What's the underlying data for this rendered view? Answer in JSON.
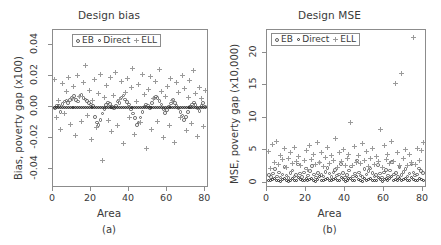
{
  "figure": {
    "panels": [
      {
        "tag": "(a)",
        "title": "Design bias",
        "xlabel": "Area",
        "ylabel": "Bias, poverty gap (x100)",
        "xticks": [
          "0",
          "20",
          "40",
          "60",
          "80"
        ],
        "yticks": [
          "-0.04",
          "-0.02",
          "0.00",
          "0.02",
          "0.04"
        ]
      },
      {
        "tag": "(b)",
        "title": "Design MSE",
        "xlabel": "Area",
        "ylabel": "MSE, poverty gap (x10,000)",
        "xticks": [
          "0",
          "20",
          "40",
          "60",
          "80"
        ],
        "yticks": [
          "0",
          "5",
          "10",
          "15",
          "20"
        ]
      }
    ],
    "legend": {
      "entries": [
        {
          "label": "EB",
          "marker": "open-circle-icon",
          "color": "#5c5c5c"
        },
        {
          "label": "Direct",
          "marker": "filled-circle-icon",
          "color": "#2a2a2a"
        },
        {
          "label": "ELL",
          "marker": "plus-icon",
          "color": "#9a9a9a"
        }
      ]
    }
  },
  "chart_data": [
    {
      "type": "scatter",
      "title": "Design bias",
      "xlabel": "Area",
      "ylabel": "Bias, poverty gap (x100)",
      "panel": "(a)",
      "xlim": [
        0,
        82
      ],
      "ylim": [
        -0.052,
        0.05
      ],
      "xticks": [
        0,
        20,
        40,
        60,
        80
      ],
      "yticks": [
        -0.04,
        -0.02,
        0.0,
        0.02,
        0.04
      ],
      "grid": false,
      "legend_position": "top-center-inside",
      "reference_line_y": 0,
      "x": [
        1,
        2,
        3,
        4,
        5,
        6,
        7,
        8,
        9,
        10,
        11,
        12,
        13,
        14,
        15,
        16,
        17,
        18,
        19,
        20,
        21,
        22,
        23,
        24,
        25,
        26,
        27,
        28,
        29,
        30,
        31,
        32,
        33,
        34,
        35,
        36,
        37,
        38,
        39,
        40,
        41,
        42,
        43,
        44,
        45,
        46,
        47,
        48,
        49,
        50,
        51,
        52,
        53,
        54,
        55,
        56,
        57,
        58,
        59,
        60,
        61,
        62,
        63,
        64,
        65,
        66,
        67,
        68,
        69,
        70,
        71,
        72,
        73,
        74,
        75,
        76,
        77,
        78,
        79,
        80
      ],
      "series": [
        {
          "name": "EB",
          "marker": "open-circle",
          "values": [
            -0.0005,
            0.0012,
            0.0008,
            -0.003,
            0.0021,
            0.0039,
            0.0045,
            0.0028,
            0.0049,
            0.0061,
            0.0073,
            0.0048,
            0.0039,
            0.007,
            0.0082,
            0.006,
            0.0052,
            0.0043,
            0.0028,
            0.0018,
            0.001,
            -0.006,
            -0.0098,
            -0.0115,
            -0.0082,
            -0.004,
            -0.001,
            0.0014,
            0.0032,
            0.0021,
            0.0004,
            -0.0008,
            0.001,
            0.0038,
            0.003,
            0.0063,
            0.0078,
            0.0052,
            0.0036,
            0.0018,
            -0.0012,
            -0.0038,
            -0.007,
            -0.0112,
            -0.0098,
            -0.0065,
            -0.003,
            0.0006,
            0.002,
            0.0012,
            -0.0004,
            0.003,
            0.0058,
            0.0072,
            0.0061,
            0.004,
            0.0018,
            -0.001,
            -0.0034,
            -0.0018,
            0.0006,
            0.0026,
            0.0048,
            0.003,
            0.0012,
            -0.0008,
            -0.0028,
            -0.0052,
            -0.008,
            -0.0062,
            -0.003,
            0.0002,
            0.0018,
            0.0032,
            0.0014,
            -0.0006,
            -0.0022,
            0.001,
            0.0028,
            0.0006
          ]
        },
        {
          "name": "Direct",
          "marker": "filled-circle",
          "values": [
            0.0,
            0.0001,
            -0.0001,
            0.0,
            0.0002,
            -0.0001,
            0.0,
            0.0001,
            -0.0002,
            0.0,
            0.0001,
            0.0,
            -0.0001,
            0.0002,
            0.0,
            0.0001,
            -0.0001,
            0.0,
            0.0001,
            -0.0002,
            0.0,
            0.0001,
            0.0,
            -0.0001,
            0.0002,
            0.0,
            -0.0001,
            0.0001,
            0.0,
            0.0002,
            -0.0001,
            0.0,
            0.0001,
            -0.0002,
            0.0,
            0.0001,
            0.0,
            -0.0001,
            0.0002,
            0.0,
            0.0001,
            -0.0001,
            0.0,
            0.0002,
            -0.0001,
            0.0,
            0.0001,
            0.0,
            -0.0002,
            0.0001,
            0.0,
            -0.0001,
            0.0002,
            0.0,
            0.0001,
            -0.0001,
            0.0,
            0.0002,
            0.0,
            -0.0001,
            0.0001,
            0.0,
            -0.0002,
            0.0001,
            0.0,
            0.0002,
            -0.0001,
            0.0,
            0.0001,
            -0.0001,
            0.0,
            0.0002,
            0.0,
            -0.0001,
            0.0001,
            0.0,
            -0.0002,
            0.0001,
            0.0,
            0.0001
          ]
        },
        {
          "name": "ELL",
          "marker": "plus",
          "values": [
            0.0182,
            -0.0068,
            0.0048,
            -0.014,
            0.0155,
            -0.0042,
            0.0104,
            0.0196,
            -0.0112,
            0.006,
            0.0138,
            -0.018,
            0.0205,
            0.0072,
            -0.0092,
            0.0158,
            0.0268,
            -0.0055,
            0.0112,
            -0.0205,
            0.0046,
            0.0178,
            -0.0128,
            0.0092,
            0.0215,
            -0.034,
            0.0064,
            0.0142,
            -0.0085,
            0.0196,
            -0.0158,
            0.0078,
            0.0225,
            -0.0118,
            0.0052,
            0.0168,
            -0.0235,
            0.0098,
            0.0188,
            -0.0062,
            0.0128,
            0.0252,
            -0.0175,
            0.004,
            0.0145,
            -0.0098,
            0.0212,
            0.0082,
            -0.0268,
            0.0118,
            0.0198,
            -0.0142,
            0.0058,
            0.0165,
            -0.0088,
            0.0248,
            0.0102,
            -0.0192,
            0.0072,
            0.0138,
            -0.0115,
            0.0185,
            0.0042,
            -0.0228,
            0.0158,
            0.0095,
            -0.0068,
            0.0205,
            0.0122,
            -0.0148,
            0.0065,
            0.0175,
            -0.0102,
            0.0238,
            0.0088,
            -0.0185,
            0.0132,
            0.0058,
            -0.0122,
            0.0108
          ]
        }
      ]
    },
    {
      "type": "scatter",
      "title": "Design MSE",
      "xlabel": "Area",
      "ylabel": "MSE, poverty gap (x10,000)",
      "panel": "(b)",
      "xlim": [
        0,
        82
      ],
      "ylim": [
        -0.8,
        23.5
      ],
      "xticks": [
        0,
        20,
        40,
        60,
        80
      ],
      "yticks": [
        0,
        5,
        10,
        15,
        20
      ],
      "grid": false,
      "legend_position": "top-left-inside",
      "x": [
        1,
        2,
        3,
        4,
        5,
        6,
        7,
        8,
        9,
        10,
        11,
        12,
        13,
        14,
        15,
        16,
        17,
        18,
        19,
        20,
        21,
        22,
        23,
        24,
        25,
        26,
        27,
        28,
        29,
        30,
        31,
        32,
        33,
        34,
        35,
        36,
        37,
        38,
        39,
        40,
        41,
        42,
        43,
        44,
        45,
        46,
        47,
        48,
        49,
        50,
        51,
        52,
        53,
        54,
        55,
        56,
        57,
        58,
        59,
        60,
        61,
        62,
        63,
        64,
        65,
        66,
        67,
        68,
        69,
        70,
        71,
        72,
        73,
        74,
        75,
        76,
        77,
        78,
        79,
        80
      ],
      "series": [
        {
          "name": "EB",
          "marker": "open-circle",
          "values": [
            1.2,
            0.9,
            1.4,
            2.1,
            1.0,
            1.6,
            0.8,
            1.3,
            2.4,
            1.1,
            0.7,
            1.5,
            1.9,
            1.0,
            1.2,
            2.8,
            1.4,
            0.9,
            1.6,
            2.2,
            1.1,
            1.8,
            2.6,
            1.3,
            0.8,
            1.5,
            3.1,
            1.2,
            1.0,
            1.7,
            2.3,
            1.4,
            0.9,
            1.6,
            2.0,
            1.1,
            1.3,
            2.9,
            1.5,
            0.8,
            1.2,
            1.9,
            2.5,
            1.0,
            1.4,
            3.4,
            1.6,
            1.1,
            0.9,
            2.1,
            1.3,
            1.8,
            2.2,
            1.5,
            1.0,
            1.2,
            2.7,
            1.4,
            0.8,
            1.6,
            2.0,
            1.1,
            1.9,
            3.2,
            1.3,
            1.5,
            0.9,
            2.4,
            1.2,
            1.7,
            2.1,
            1.0,
            1.4,
            2.8,
            1.6,
            1.1,
            1.3,
            2.2,
            1.8,
            1.5
          ]
        },
        {
          "name": "Direct",
          "marker": "filled-circle",
          "values": [
            0.4,
            0.3,
            0.5,
            0.6,
            0.3,
            0.4,
            0.2,
            0.5,
            0.7,
            0.3,
            0.2,
            0.4,
            0.6,
            0.3,
            0.4,
            0.8,
            0.5,
            0.3,
            0.4,
            0.6,
            0.3,
            0.5,
            0.7,
            0.4,
            0.2,
            0.5,
            0.9,
            0.4,
            0.3,
            0.5,
            0.6,
            0.4,
            0.3,
            0.5,
            0.6,
            0.3,
            0.4,
            0.8,
            0.5,
            0.2,
            0.4,
            0.6,
            0.7,
            0.3,
            0.4,
            1.0,
            0.5,
            0.3,
            0.2,
            0.6,
            0.4,
            0.5,
            0.6,
            0.4,
            0.3,
            0.4,
            0.8,
            0.5,
            0.2,
            0.5,
            0.6,
            0.3,
            0.6,
            0.9,
            0.4,
            0.5,
            0.3,
            0.7,
            0.4,
            0.5,
            0.6,
            0.3,
            0.4,
            0.8,
            0.5,
            0.3,
            0.4,
            0.6,
            0.5,
            0.4
          ]
        },
        {
          "name": "ELL",
          "marker": "plus",
          "values": [
            4.8,
            2.2,
            5.9,
            3.1,
            6.4,
            2.8,
            4.2,
            3.6,
            5.2,
            2.4,
            3.8,
            4.6,
            2.9,
            5.5,
            3.2,
            4.1,
            2.6,
            22.6,
            3.4,
            4.9,
            2.1,
            5.8,
            3.6,
            4.4,
            2.8,
            6.2,
            3.1,
            4.7,
            2.5,
            3.9,
            5.4,
            2.9,
            4.2,
            3.5,
            6.8,
            2.3,
            4.6,
            3.2,
            5.1,
            2.7,
            3.8,
            4.4,
            9.2,
            2.6,
            5.6,
            3.1,
            4.2,
            2.9,
            6.1,
            3.4,
            4.8,
            2.5,
            3.7,
            5.2,
            2.8,
            4.1,
            3.3,
            8.2,
            2.4,
            5.7,
            3.6,
            4.3,
            2.9,
            6.4,
            3.2,
            15.3,
            4.6,
            2.7,
            16.8,
            3.8,
            5.1,
            2.6,
            4.4,
            3.1,
            22.4,
            2.8,
            5.3,
            3.5,
            4.9,
            6.2
          ]
        }
      ]
    }
  ]
}
